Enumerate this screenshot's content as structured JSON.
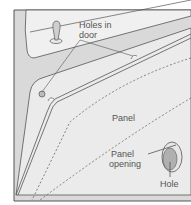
{
  "diagram": {
    "labels": {
      "holes_in_door_line1": "Holes in",
      "holes_in_door_line2": "door",
      "panel": "Panel",
      "panel_opening_line1": "Panel",
      "panel_opening_line2": "opening",
      "hole": "Hole"
    },
    "colors": {
      "background": "#ffffff",
      "door_fill": "#d9d9d9",
      "panel_fill": "#ebebeb",
      "window_fill": "#f0f0f0",
      "line": "#555555",
      "dashed_line": "#666666",
      "hole_fill": "#b0b0b0",
      "text": "#555555"
    }
  }
}
